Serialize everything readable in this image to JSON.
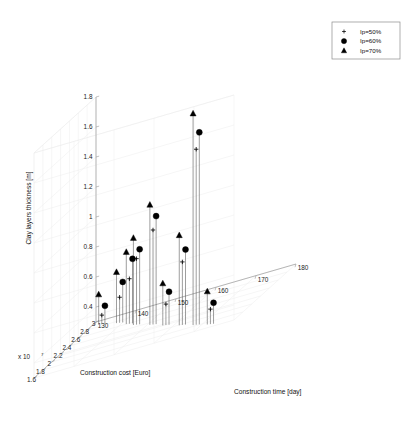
{
  "figure": {
    "background_color": "#ffffff",
    "axis_color": "#9a9a9a",
    "grid_color": "#ececec",
    "marker_color": "#000000",
    "stem_color": "#4d4d4d"
  },
  "legend": {
    "position": "top-right",
    "border_color": "#8c8c8c",
    "entries": [
      {
        "marker": "plus",
        "label": "Ip=50%"
      },
      {
        "marker": "circle",
        "label": "Ip=60%"
      },
      {
        "marker": "triangle",
        "label": "Ip=70%"
      }
    ]
  },
  "chart_data": {
    "type": "scatter",
    "title": "",
    "subtype": "3d-stem-plot",
    "xlabel": "Construction time [day]",
    "ylabel": "Construction cost [Euro]",
    "zlabel": "Clay layers thickness [m]",
    "y_exponent_label": "x 10",
    "y_exponent_value": "7",
    "xlim": [
      130,
      180
    ],
    "ylim": [
      1.6,
      3.0
    ],
    "zlim": [
      0.3,
      1.8
    ],
    "xticks": [
      130,
      140,
      150,
      160,
      170,
      180
    ],
    "yticks": [
      1.6,
      1.8,
      2,
      2.2,
      2.4,
      2.6,
      2.8,
      3
    ],
    "zticks": [
      0.4,
      0.6,
      0.8,
      1,
      1.2,
      1.4,
      1.6,
      1.8
    ],
    "xtick_labels": [
      "130",
      "140",
      "150",
      "160",
      "170",
      "180"
    ],
    "ytick_labels": [
      "1.6",
      "1.8",
      "2",
      "2.2",
      "2.4",
      "2.6",
      "2.8",
      "3"
    ],
    "ztick_labels": [
      "0.4",
      "0.6",
      "0.8",
      "1",
      "1.2",
      "1.4",
      "1.6",
      "1.8"
    ],
    "grid": true,
    "legend_position": "upper right",
    "series": [
      {
        "name": "Ip=50%",
        "marker": "plus",
        "points": [
          {
            "x": 133,
            "y": 2.86,
            "z": 0.36
          },
          {
            "x": 139,
            "y": 2.72,
            "z": 0.47
          },
          {
            "x": 143,
            "y": 2.58,
            "z": 0.6
          },
          {
            "x": 146,
            "y": 2.47,
            "z": 0.74
          },
          {
            "x": 152,
            "y": 2.3,
            "z": 0.93
          },
          {
            "x": 157,
            "y": 2.14,
            "z": 0.44
          },
          {
            "x": 163,
            "y": 1.97,
            "z": 0.72
          },
          {
            "x": 168,
            "y": 1.83,
            "z": 1.47
          },
          {
            "x": 173,
            "y": 1.7,
            "z": 0.4
          }
        ]
      },
      {
        "name": "Ip=60%",
        "marker": "circle",
        "points": [
          {
            "x": 134,
            "y": 2.84,
            "z": 0.42
          },
          {
            "x": 140,
            "y": 2.7,
            "z": 0.57
          },
          {
            "x": 144,
            "y": 2.56,
            "z": 0.73
          },
          {
            "x": 147,
            "y": 2.45,
            "z": 0.8
          },
          {
            "x": 153,
            "y": 2.28,
            "z": 1.02
          },
          {
            "x": 158,
            "y": 2.12,
            "z": 0.52
          },
          {
            "x": 164,
            "y": 1.95,
            "z": 0.8
          },
          {
            "x": 169,
            "y": 1.81,
            "z": 1.58
          },
          {
            "x": 174,
            "y": 1.68,
            "z": 0.44
          }
        ]
      },
      {
        "name": "Ip=70%",
        "marker": "triangle",
        "points": [
          {
            "x": 132,
            "y": 2.88,
            "z": 0.5
          },
          {
            "x": 138,
            "y": 2.74,
            "z": 0.64
          },
          {
            "x": 142,
            "y": 2.6,
            "z": 0.78
          },
          {
            "x": 145,
            "y": 2.49,
            "z": 0.88
          },
          {
            "x": 151,
            "y": 2.32,
            "z": 1.1
          },
          {
            "x": 156,
            "y": 2.16,
            "z": 0.58
          },
          {
            "x": 162,
            "y": 1.99,
            "z": 0.9
          },
          {
            "x": 167,
            "y": 1.85,
            "z": 1.71
          },
          {
            "x": 172,
            "y": 1.72,
            "z": 0.52
          }
        ]
      }
    ]
  }
}
